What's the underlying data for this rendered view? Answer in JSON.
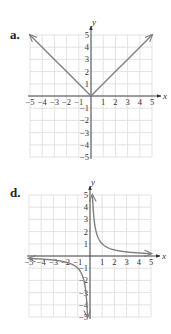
{
  "panels": [
    {
      "label": "a.",
      "top": 0
    },
    {
      "label": "d.",
      "top": 160
    }
  ],
  "colors": {
    "grid": "#dcdcdc",
    "axis": "#333333",
    "curve": "#808080",
    "text": "#333333"
  },
  "chart_data": [
    {
      "type": "line",
      "panel": "a.",
      "title": "",
      "function": "y = |x|",
      "xlabel": "x",
      "ylabel": "y",
      "xlim": [
        -5,
        5
      ],
      "ylim": [
        -5,
        5
      ],
      "grid": true,
      "x_ticks": [
        -5,
        -4,
        -3,
        -2,
        -1,
        1,
        2,
        3,
        4,
        5
      ],
      "y_ticks": [
        -5,
        -4,
        -3,
        -2,
        -1,
        1,
        2,
        3,
        4,
        5
      ],
      "x": [
        -5,
        -4,
        -3,
        -2,
        -1,
        0,
        1,
        2,
        3,
        4,
        5
      ],
      "y": [
        5,
        4,
        3,
        2,
        1,
        0,
        1,
        2,
        3,
        4,
        5
      ],
      "arrows": "both ends"
    },
    {
      "type": "line",
      "panel": "d.",
      "title": "",
      "function": "y = 1/x",
      "xlabel": "x",
      "ylabel": "y",
      "xlim": [
        -5,
        5
      ],
      "ylim": [
        -5,
        5
      ],
      "grid": true,
      "x_ticks": [
        -5,
        -4,
        -3,
        -2,
        -1,
        1,
        2,
        3,
        4,
        5
      ],
      "y_ticks": [
        -5,
        -4,
        -3,
        -2,
        -1,
        1,
        2,
        3,
        4,
        5
      ],
      "series": [
        {
          "name": "x>0 branch",
          "x": [
            0.2,
            0.25,
            0.5,
            1,
            2,
            3,
            4,
            5
          ],
          "y": [
            5,
            4,
            2,
            1,
            0.5,
            0.33,
            0.25,
            0.2
          ]
        },
        {
          "name": "x<0 branch",
          "x": [
            -5,
            -4,
            -3,
            -2,
            -1,
            -0.5,
            -0.25,
            -0.2
          ],
          "y": [
            -0.2,
            -0.25,
            -0.33,
            -0.5,
            -1,
            -2,
            -4,
            -5
          ]
        }
      ],
      "asymptotes": {
        "x": 0,
        "y": 0
      },
      "arrows": "both ends of each branch"
    }
  ]
}
